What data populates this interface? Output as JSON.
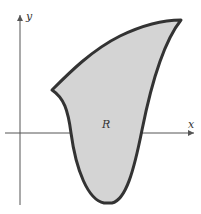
{
  "diagram": {
    "type": "region-in-plane",
    "axes": {
      "x_label": "x",
      "y_label": "y"
    },
    "region_label": "R",
    "colors": {
      "region_fill": "#d4d4d4",
      "region_stroke": "#333333",
      "axis": "#555555",
      "background": "#ffffff"
    }
  }
}
